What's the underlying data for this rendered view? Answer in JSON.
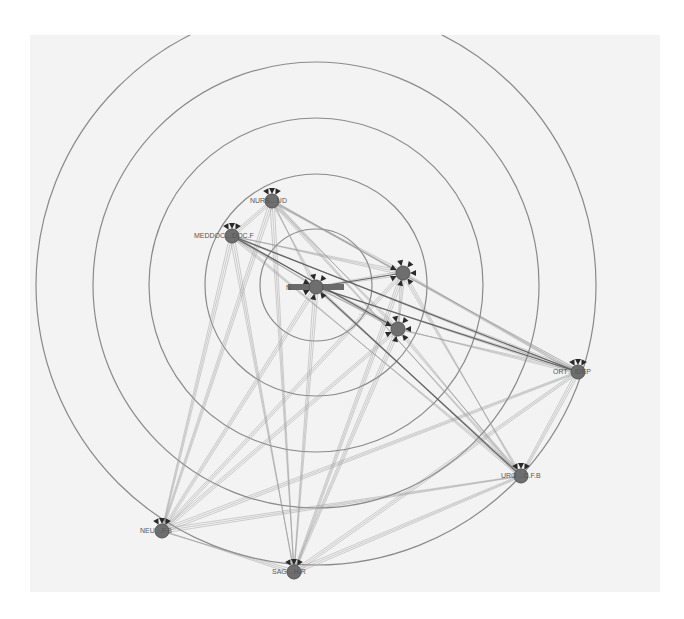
{
  "diagram": {
    "type": "radial-network",
    "background": "#f3f3f3",
    "ring_color": "#8a8a8a",
    "node_color": "#6e6e6e",
    "center": {
      "x": 316,
      "y": 285
    },
    "rings": [
      56,
      111,
      167,
      223,
      280
    ],
    "nodes": [
      {
        "id": "hub",
        "label": "N…",
        "x": 316,
        "y": 287,
        "label_dx": -30,
        "label_dy": 3
      },
      {
        "id": "nurs",
        "label": "NURS…UD",
        "x": 272,
        "y": 201,
        "label_dx": -22,
        "label_dy": 2
      },
      {
        "id": "meddoc",
        "label": "MEDDOC…DOC.F",
        "x": 232,
        "y": 236,
        "label_dx": -38,
        "label_dy": 2
      },
      {
        "id": "n4",
        "label": "",
        "x": 403,
        "y": 273,
        "label_dx": 0,
        "label_dy": 0
      },
      {
        "id": "n5",
        "label": "…",
        "x": 398,
        "y": 329,
        "label_dx": -40,
        "label_dy": -14
      },
      {
        "id": "ort",
        "label": "ORT…IDEP",
        "x": 578,
        "y": 372,
        "label_dx": -25,
        "label_dy": 2
      },
      {
        "id": "uro",
        "label": "URO…C.F.B",
        "x": 521,
        "y": 476,
        "label_dx": -20,
        "label_dy": 2
      },
      {
        "id": "neu",
        "label": "NEU…F.B",
        "x": 162,
        "y": 531,
        "label_dx": -22,
        "label_dy": 2
      },
      {
        "id": "sag",
        "label": "SAG…H.R",
        "x": 294,
        "y": 572,
        "label_dx": -22,
        "label_dy": 2
      }
    ],
    "edges_from_hub": [
      "nurs",
      "meddoc",
      "n4",
      "n5",
      "ort",
      "uro",
      "neu",
      "sag"
    ],
    "strong_edges": [
      [
        "hub",
        "ort"
      ],
      [
        "hub",
        "n4"
      ],
      [
        "meddoc",
        "ort"
      ],
      [
        "meddoc",
        "n5"
      ],
      [
        "hub",
        "uro"
      ]
    ]
  }
}
